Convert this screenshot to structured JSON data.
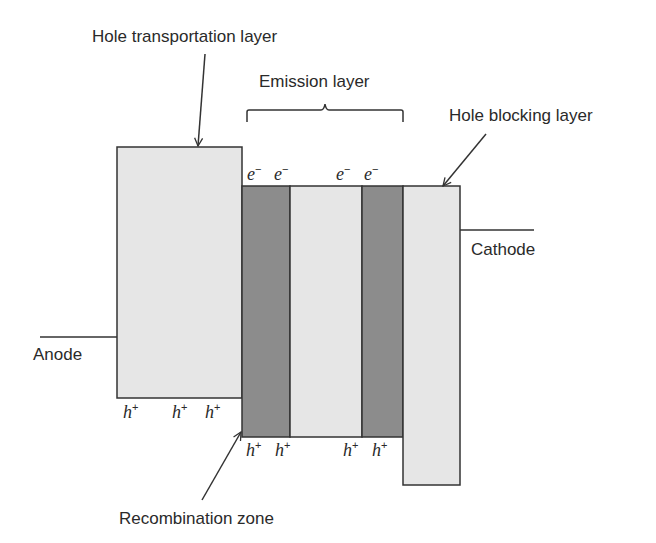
{
  "diagram": {
    "type": "OLED energy level / layer structure",
    "colors": {
      "light_fill": "#e6e6e6",
      "dark_fill": "#8c8c8c",
      "stroke": "#333333",
      "text": "#2a2a2a"
    },
    "labels": {
      "htl": "Hole transportation layer",
      "eml": "Emission layer",
      "hbl": "Hole blocking layer",
      "anode": "Anode",
      "cathode": "Cathode",
      "recombination": "Recombination zone"
    },
    "carriers": {
      "electron": "e",
      "electron_sup": "−",
      "hole": "h",
      "hole_sup": "+"
    },
    "layers": [
      {
        "name": "Hole transportation layer",
        "shade": "light"
      },
      {
        "name": "Emission sublayer 1",
        "shade": "dark"
      },
      {
        "name": "Emission sublayer 2",
        "shade": "light"
      },
      {
        "name": "Emission sublayer 3",
        "shade": "dark"
      },
      {
        "name": "Hole blocking layer",
        "shade": "light"
      }
    ]
  }
}
